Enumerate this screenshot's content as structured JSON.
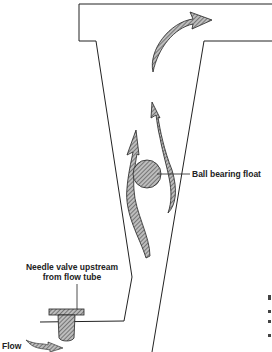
{
  "diagram": {
    "type": "rotameter cross-section",
    "labels": {
      "float": "Ball bearing float",
      "needle_valve_line1": "Needle valve upstream",
      "needle_valve_line2": "from flow tube",
      "flow": "Flow"
    },
    "colors": {
      "line": "#222222",
      "hatch": "#555555",
      "background": "#ffffff"
    }
  }
}
